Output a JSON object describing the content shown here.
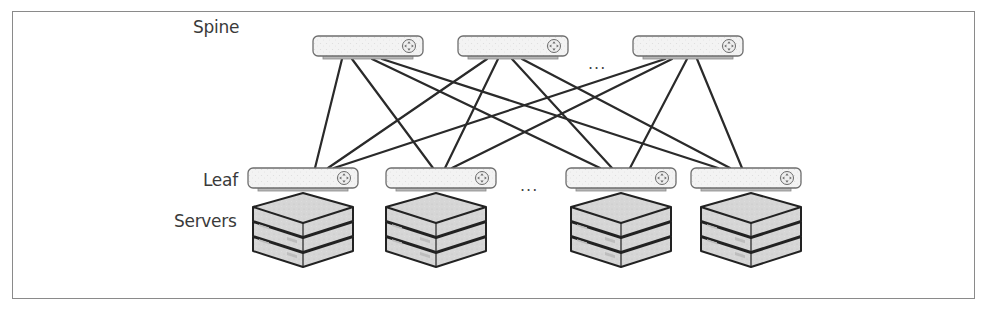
{
  "diagram": {
    "labels": {
      "spine": "Spine",
      "leaf": "Leaf",
      "servers": "Servers"
    },
    "ellipsis": "...",
    "spine_switches": [
      {
        "id": "spine-1",
        "x": 313,
        "y": 36
      },
      {
        "id": "spine-2",
        "x": 458,
        "y": 36
      },
      {
        "id": "spine-3",
        "x": 633,
        "y": 36
      }
    ],
    "leaf_switches": [
      {
        "id": "leaf-1",
        "x": 248,
        "y": 168
      },
      {
        "id": "leaf-2",
        "x": 386,
        "y": 168
      },
      {
        "id": "leaf-3",
        "x": 566,
        "y": 168
      },
      {
        "id": "leaf-4",
        "x": 691,
        "y": 168
      }
    ],
    "server_stacks": [
      {
        "leaf": "leaf-1",
        "count": 3
      },
      {
        "leaf": "leaf-2",
        "count": 3
      },
      {
        "leaf": "leaf-3",
        "count": 3
      },
      {
        "leaf": "leaf-4",
        "count": 3
      }
    ],
    "links": [
      {
        "from": "spine-1",
        "to": "leaf-1",
        "x1": 342,
        "y1": 60,
        "x2": 315,
        "y2": 168
      },
      {
        "from": "spine-1",
        "to": "leaf-2",
        "x1": 352,
        "y1": 60,
        "x2": 433,
        "y2": 168
      },
      {
        "from": "spine-1",
        "to": "leaf-3",
        "x1": 372,
        "y1": 60,
        "x2": 600,
        "y2": 168
      },
      {
        "from": "spine-1",
        "to": "leaf-4",
        "x1": 382,
        "y1": 60,
        "x2": 718,
        "y2": 168
      },
      {
        "from": "spine-2",
        "to": "leaf-1",
        "x1": 487,
        "y1": 60,
        "x2": 328,
        "y2": 168
      },
      {
        "from": "spine-2",
        "to": "leaf-2",
        "x1": 498,
        "y1": 60,
        "x2": 445,
        "y2": 168
      },
      {
        "from": "spine-2",
        "to": "leaf-3",
        "x1": 512,
        "y1": 60,
        "x2": 612,
        "y2": 168
      },
      {
        "from": "spine-2",
        "to": "leaf-4",
        "x1": 522,
        "y1": 60,
        "x2": 730,
        "y2": 168
      },
      {
        "from": "spine-3",
        "to": "leaf-1",
        "x1": 665,
        "y1": 60,
        "x2": 334,
        "y2": 168
      },
      {
        "from": "spine-3",
        "to": "leaf-2",
        "x1": 672,
        "y1": 60,
        "x2": 452,
        "y2": 168
      },
      {
        "from": "spine-3",
        "to": "leaf-3",
        "x1": 687,
        "y1": 60,
        "x2": 630,
        "y2": 168
      },
      {
        "from": "spine-3",
        "to": "leaf-4",
        "x1": 697,
        "y1": 60,
        "x2": 742,
        "y2": 168
      }
    ],
    "colors": {
      "border": "#8a8a8a",
      "switch_fill": "#f2f2f2",
      "switch_stroke": "#6e6e6e",
      "switch_base": "#b8b8b8",
      "server_fill": "#d8d8d8",
      "server_stroke": "#222222",
      "link": "#2a2a2a",
      "text": "#3a3a3a"
    }
  }
}
